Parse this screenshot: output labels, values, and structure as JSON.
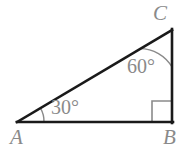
{
  "figure": {
    "kind": "right-triangle-diagram",
    "background_color": "#ffffff",
    "stroke_color": "#1a1a1a",
    "annotation_color": "#8a8a8a",
    "vertices": {
      "A": {
        "label": "A",
        "x": 18,
        "y": 122
      },
      "B": {
        "label": "B",
        "x": 172,
        "y": 122
      },
      "C": {
        "label": "C",
        "x": 172,
        "y": 30
      }
    },
    "edges": [
      {
        "name": "base-AB",
        "from": "A",
        "to": "B"
      },
      {
        "name": "vertical-BC",
        "from": "B",
        "to": "C"
      },
      {
        "name": "hypotenuse-AC",
        "from": "A",
        "to": "C"
      }
    ],
    "angles": [
      {
        "at": "A",
        "label": "30°",
        "value": 30,
        "marker": "arc"
      },
      {
        "at": "C",
        "label": "60°",
        "value": 60,
        "marker": "arc"
      },
      {
        "at": "B",
        "label": "",
        "value": 90,
        "marker": "square"
      }
    ]
  }
}
